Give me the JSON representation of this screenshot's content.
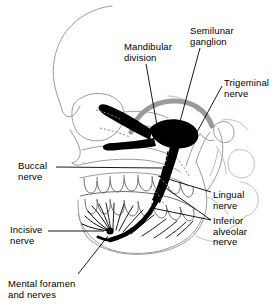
{
  "figure": {
    "background_color": "#ffffff",
    "line_color": "#000000",
    "bone_outline_color": "#8c8c8c",
    "bone_outline_light_color": "#b4b4b4",
    "nerve_color": "#000000",
    "cranial_arc_color": "#9a9a9a",
    "text_color": "#000000"
  },
  "labels": [
    {
      "id": "mandibular-division",
      "text": "Mandibular\ndivision",
      "x": 124,
      "y": 42,
      "align": "left"
    },
    {
      "id": "semilunar-ganglion",
      "text": "Semilunar\nganglion",
      "x": 190,
      "y": 26,
      "align": "left"
    },
    {
      "id": "trigeminal-nerve",
      "text": "Trigeminal\nnerve",
      "x": 224,
      "y": 78,
      "align": "left"
    },
    {
      "id": "buccal-nerve",
      "text": "Buccal\nnerve",
      "x": 18,
      "y": 161,
      "align": "left"
    },
    {
      "id": "lingual-nerve",
      "text": "Lingual\nnerve",
      "x": 213,
      "y": 190,
      "align": "left"
    },
    {
      "id": "inferior-alveolar-nerve",
      "text": "Inferior\nalveolar\nnerve",
      "x": 213,
      "y": 216,
      "align": "left"
    },
    {
      "id": "incisive-nerve",
      "text": "Incisive\nnerve",
      "x": 10,
      "y": 225,
      "align": "left"
    },
    {
      "id": "mental-foramen-and-nerves",
      "text": "Mental foramen\nand nerves",
      "x": 8,
      "y": 279,
      "align": "left"
    }
  ],
  "structures": [
    {
      "id": "cranium",
      "name": "cranium-outline"
    },
    {
      "id": "cranial-base-arc",
      "name": "cranial-base-arc"
    },
    {
      "id": "orbit",
      "name": "orbit-outline"
    },
    {
      "id": "nasal-aperture",
      "name": "nasal-aperture-outline"
    },
    {
      "id": "zygomatic-arch",
      "name": "zygomatic-arch-outline"
    },
    {
      "id": "maxilla",
      "name": "maxilla-outline"
    },
    {
      "id": "mandible",
      "name": "mandible-outline"
    },
    {
      "id": "upper-teeth",
      "name": "upper-teeth-row"
    },
    {
      "id": "lower-teeth",
      "name": "lower-teeth-row"
    },
    {
      "id": "cervical-vertebrae",
      "name": "cervical-vertebrae-outline"
    },
    {
      "id": "trigeminal-ganglion",
      "name": "semilunar-ganglion-body"
    },
    {
      "id": "nerve-trunk",
      "name": "mandibular-nerve-trunk"
    },
    {
      "id": "inferior-alveolar-branch",
      "name": "inferior-alveolar-nerve-branch"
    },
    {
      "id": "lingual-branch",
      "name": "lingual-nerve-branch"
    },
    {
      "id": "buccal-branch",
      "name": "buccal-nerve-branch"
    },
    {
      "id": "mental-foramen",
      "name": "mental-foramen-point"
    },
    {
      "id": "dental-branches",
      "name": "dental-nerve-branches"
    }
  ]
}
